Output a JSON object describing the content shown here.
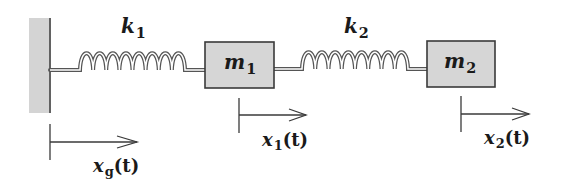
{
  "diagram": {
    "colors": {
      "background": "#ffffff",
      "wall_fill": "#d4d4d4",
      "mass_fill": "#d6d6d6",
      "outline": "#3a3a3a",
      "spring": "#555555",
      "text": "#1a1a1a"
    },
    "wall": {
      "label": "ground"
    },
    "springs": [
      {
        "id": "k1",
        "symbol": "k",
        "subscript": "1",
        "coils": 8
      },
      {
        "id": "k2",
        "symbol": "k",
        "subscript": "2",
        "coils": 8
      }
    ],
    "masses": [
      {
        "id": "m1",
        "symbol": "m",
        "subscript": "1"
      },
      {
        "id": "m2",
        "symbol": "m",
        "subscript": "2"
      }
    ],
    "displacements": [
      {
        "id": "xg",
        "symbol": "x",
        "subscript": "g",
        "arg": "(t)"
      },
      {
        "id": "x1",
        "symbol": "x",
        "subscript": "1",
        "arg": "(t)"
      },
      {
        "id": "x2",
        "symbol": "x",
        "subscript": "2",
        "arg": "(t)"
      }
    ]
  }
}
